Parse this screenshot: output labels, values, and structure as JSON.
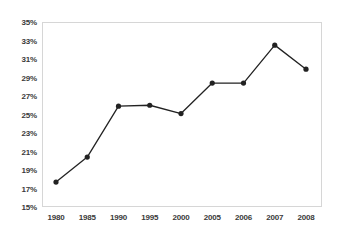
{
  "chart_data": {
    "type": "line",
    "title": "",
    "subtitle": "",
    "xlabel": "",
    "ylabel": "",
    "categories": [
      "1980",
      "1985",
      "1990",
      "1995",
      "2000",
      "2005",
      "2006",
      "2007",
      "2008"
    ],
    "values": [
      17.7,
      20.4,
      25.9,
      26.0,
      25.1,
      28.4,
      28.4,
      32.5,
      29.9
    ],
    "value_suffix": "%",
    "ylim": [
      15,
      35
    ],
    "y_tick_step": 2,
    "y_tick_labels": [
      "35%",
      "33%",
      "31%",
      "29%",
      "27%",
      "25%",
      "23%",
      "21%",
      "19%",
      "17%",
      "15%"
    ],
    "y_tick_values": [
      35,
      33,
      31,
      29,
      27,
      25,
      23,
      21,
      19,
      17,
      15
    ],
    "grid": false,
    "legend": "none",
    "series": [
      {
        "name": "",
        "values": [
          17.7,
          20.4,
          25.9,
          26.0,
          25.1,
          28.4,
          28.4,
          32.5,
          29.9
        ]
      }
    ]
  },
  "style": {
    "line_color": "#222222",
    "marker_color": "#222222",
    "frame_color": "#d6d6d6",
    "label_color": "#3a3a3a",
    "background": "#ffffff"
  }
}
